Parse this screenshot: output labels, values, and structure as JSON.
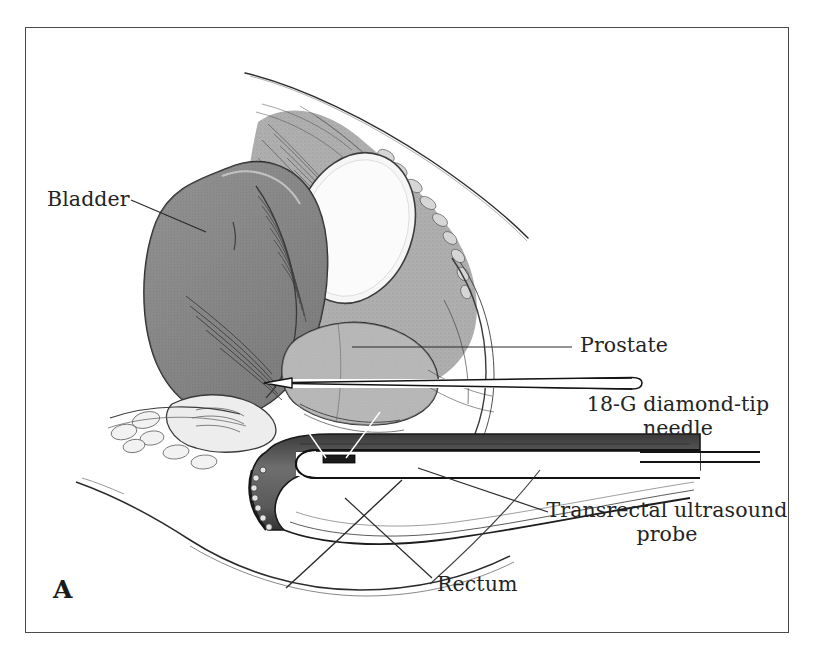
{
  "figure": {
    "panel_letter": "A",
    "caption_hidden": "",
    "frame": {
      "border_color": "#4a4a4a",
      "background_color": "#ffffff"
    }
  },
  "labels": [
    {
      "id": "bladder",
      "text": "Bladder",
      "side": "left",
      "leader": "line-from-text-to-bladder"
    },
    {
      "id": "prostate",
      "text": "Prostate",
      "side": "right",
      "leader": "horizontal-line-to-prostate"
    },
    {
      "id": "needle",
      "text": "18-G diamond-tip\nneedle",
      "line1": "18-G diamond-tip",
      "line2": "needle",
      "side": "right",
      "leader": "needle-shaft"
    },
    {
      "id": "probe",
      "text": "Transrectal ultrasound\nprobe",
      "line1": "Transrectal ultrasound",
      "line2": "probe",
      "side": "right",
      "leader": "line-to-probe-shaft"
    },
    {
      "id": "rectum",
      "text": "Rectum",
      "side": "bottom",
      "leader": "line-to-rectal-wall"
    }
  ],
  "anatomy": {
    "bladder": {
      "name": "Bladder",
      "fill_color": "#868686",
      "outline_color": "#2a2a2a"
    },
    "pubic_bone": {
      "name": "Pubic bone",
      "fill_color": "#f4f4f4",
      "outline_color": "#3a3a3a"
    },
    "prostate": {
      "name": "Prostate",
      "fill_color": "#b4b4b4",
      "outline_color": "#2a2a2a"
    },
    "rectum": {
      "name": "Rectum",
      "fill_color": "#6e6e6e",
      "outline_color": "#1e1e1e"
    },
    "soft_tissue": {
      "name": "Pelvic soft tissue",
      "fill_color": "#a9a9a9"
    },
    "body_wall": {
      "name": "Abdominal and perineal contour",
      "outline_color": "#2b2b2b"
    }
  },
  "instruments": {
    "needle": {
      "name": "18-G diamond-tip needle",
      "body_color": "#ffffff",
      "outline_color": "#1a1a1a",
      "tip_shape": "diamond"
    },
    "probe": {
      "name": "Transrectal ultrasound probe",
      "body_color": "#ffffff",
      "outline_color": "#141414",
      "transducer_color": "#1a1a1a"
    }
  },
  "colors": {
    "ink": "#242424",
    "frame": "#4a4a4a",
    "paper": "#ffffff"
  }
}
